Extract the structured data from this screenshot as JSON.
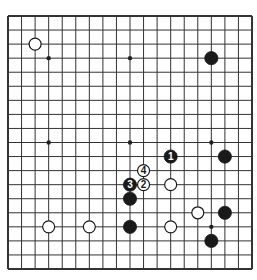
{
  "board": {
    "size": 19,
    "origin": {
      "x": 8,
      "y": 16
    },
    "spacing": {
      "x": 13.556,
      "y": 14.056
    },
    "line_color": "#333333",
    "border_width": 2,
    "line_width": 1,
    "star_points": [
      [
        3,
        3
      ],
      [
        9,
        3
      ],
      [
        15,
        3
      ],
      [
        3,
        9
      ],
      [
        9,
        9
      ],
      [
        15,
        9
      ],
      [
        3,
        15
      ],
      [
        9,
        15
      ],
      [
        15,
        15
      ]
    ],
    "stones": [
      {
        "color": "white",
        "col": 2,
        "row": 2,
        "label": ""
      },
      {
        "color": "black",
        "col": 15,
        "row": 3,
        "label": ""
      },
      {
        "color": "black",
        "col": 12,
        "row": 10,
        "label": "1"
      },
      {
        "color": "black",
        "col": 16,
        "row": 10,
        "label": ""
      },
      {
        "color": "white",
        "col": 10,
        "row": 11,
        "label": "4"
      },
      {
        "color": "black",
        "col": 9,
        "row": 12,
        "label": "3"
      },
      {
        "color": "white",
        "col": 10,
        "row": 12,
        "label": "2"
      },
      {
        "color": "white",
        "col": 12,
        "row": 12,
        "label": ""
      },
      {
        "color": "black",
        "col": 9,
        "row": 13,
        "label": ""
      },
      {
        "color": "white",
        "col": 14,
        "row": 14,
        "label": ""
      },
      {
        "color": "black",
        "col": 16,
        "row": 14,
        "label": ""
      },
      {
        "color": "white",
        "col": 3,
        "row": 15,
        "label": ""
      },
      {
        "color": "white",
        "col": 6,
        "row": 15,
        "label": ""
      },
      {
        "color": "black",
        "col": 9,
        "row": 15,
        "label": ""
      },
      {
        "color": "white",
        "col": 12,
        "row": 15,
        "label": ""
      },
      {
        "color": "black",
        "col": 15,
        "row": 16,
        "label": ""
      }
    ]
  }
}
